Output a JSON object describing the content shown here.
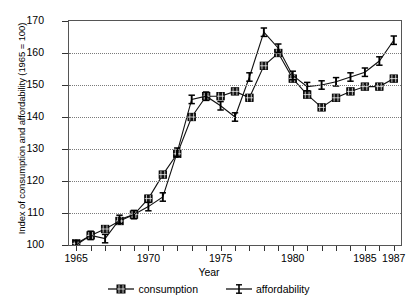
{
  "chart_data": {
    "type": "line",
    "title": "",
    "xlabel": "Year",
    "ylabel": "Index of consumption and affordability (1965 = 100)",
    "xlim": [
      1964.5,
      1987.5
    ],
    "ylim": [
      100,
      170
    ],
    "yticks": [
      100,
      110,
      120,
      130,
      140,
      150,
      160,
      170
    ],
    "xticks": [
      1965,
      1970,
      1975,
      1980,
      1985,
      1987
    ],
    "grid": true,
    "legend_position": "bottom",
    "x": [
      1965,
      1966,
      1967,
      1968,
      1969,
      1970,
      1971,
      1972,
      1973,
      1974,
      1975,
      1976,
      1977,
      1978,
      1979,
      1980,
      1981,
      1982,
      1983,
      1984,
      1985,
      1986,
      1987
    ],
    "series": [
      {
        "name": "consumption",
        "marker": "filled-square",
        "values": [
          100.5,
          103,
          105,
          107.5,
          109.5,
          114.5,
          122,
          128.5,
          140,
          146.5,
          146.5,
          148,
          146,
          156,
          160,
          152,
          147,
          143,
          146,
          148,
          149.5,
          149.5,
          152
        ]
      },
      {
        "name": "affordability",
        "marker": "error-bar",
        "values": [
          100,
          103,
          102,
          108,
          109.5,
          112,
          115,
          129,
          145.5,
          146.5,
          143.5,
          140,
          152.5,
          166.5,
          161.5,
          153,
          149.5,
          150,
          151,
          152.5,
          154,
          157.5,
          164
        ]
      }
    ]
  },
  "axis": {
    "ytick_labels": [
      "170",
      "160",
      "150",
      "140",
      "130",
      "120",
      "110",
      "100"
    ],
    "xtick_labels": [
      "1965",
      "1970",
      "1975",
      "1980",
      "1985",
      "1987"
    ],
    "x_title": "Year",
    "y_title": "Index of consumption and affordability (1965 = 100)"
  },
  "legend": {
    "items": [
      {
        "label": "consumption",
        "marker": "filled-square"
      },
      {
        "label": "affordability",
        "marker": "error-bar"
      }
    ]
  }
}
